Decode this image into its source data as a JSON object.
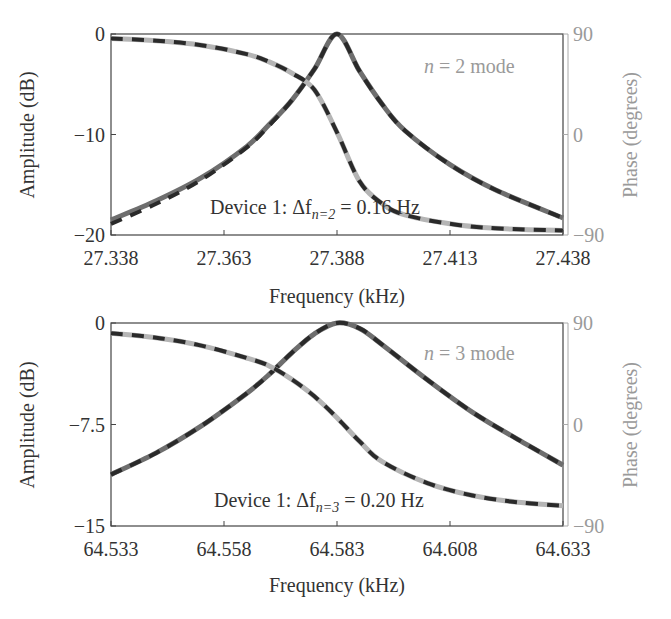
{
  "chart_data": [
    {
      "type": "line",
      "title": "",
      "mode_label": {
        "n": "n",
        "eq": " = 2 mode"
      },
      "annotation": {
        "prefix": "Device 1: Δf",
        "sub": "n=2",
        "suffix": " = 0.16 Hz"
      },
      "xlabel": "Frequency (kHz)",
      "ylabel": "Amplitude (dB)",
      "ylabel_right": "Phase (degrees)",
      "xlim": [
        27.338,
        27.438
      ],
      "ylim": [
        -20,
        0
      ],
      "ylim_right": [
        -90,
        90
      ],
      "xticks": [
        "27.338",
        "27.363",
        "27.388",
        "27.413",
        "27.438"
      ],
      "yticks": [
        "0",
        "−10",
        "−20"
      ],
      "yticks_right": [
        "90",
        "0",
        "−90"
      ],
      "grid": false,
      "resonance_khz": 27.388,
      "linewidth_hz": 0.16,
      "x": [
        27.338,
        27.348,
        27.358,
        27.368,
        27.373,
        27.378,
        27.383,
        27.388,
        27.393,
        27.398,
        27.403,
        27.413,
        27.423,
        27.438
      ],
      "series": [
        {
          "name": "Amplitude (measured)",
          "axis": "left",
          "style": "solid-gray",
          "values": [
            -18.5,
            -16.6,
            -14.3,
            -11.2,
            -9.0,
            -6.6,
            -3.5,
            0.0,
            -3.7,
            -7.0,
            -9.6,
            -13.0,
            -15.5,
            -18.3
          ]
        },
        {
          "name": "Amplitude (fit)",
          "axis": "left",
          "style": "dashed-black",
          "values": [
            -18.9,
            -16.9,
            -14.5,
            -11.3,
            -9.1,
            -6.6,
            -3.5,
            0.0,
            -3.7,
            -7.0,
            -9.6,
            -13.0,
            -15.5,
            -18.3
          ]
        },
        {
          "name": "Phase (measured)",
          "axis": "right",
          "style": "solid-lightgray",
          "values": [
            86,
            84,
            80,
            72,
            65,
            55,
            40,
            2,
            -42,
            -62,
            -72,
            -80,
            -84,
            -86
          ]
        },
        {
          "name": "Phase (fit)",
          "axis": "right",
          "style": "dashed-black",
          "values": [
            86,
            84,
            80,
            72,
            65,
            55,
            40,
            2,
            -42,
            -62,
            -72,
            -80,
            -84,
            -86
          ]
        }
      ]
    },
    {
      "type": "line",
      "title": "",
      "mode_label": {
        "n": "n",
        "eq": " = 3 mode"
      },
      "annotation": {
        "prefix": "Device 1: Δf",
        "sub": "n=3",
        "suffix": " = 0.20 Hz"
      },
      "xlabel": "Frequency (kHz)",
      "ylabel": "Amplitude (dB)",
      "ylabel_right": "Phase (degrees)",
      "xlim": [
        64.533,
        64.633
      ],
      "ylim": [
        -15,
        0
      ],
      "ylim_right": [
        -90,
        90
      ],
      "xticks": [
        "64.533",
        "64.558",
        "64.583",
        "64.608",
        "64.633"
      ],
      "yticks": [
        "0",
        "−7.5",
        "−15"
      ],
      "yticks_right": [
        "90",
        "0",
        "−90"
      ],
      "grid": false,
      "resonance_khz": 64.583,
      "linewidth_hz": 0.2,
      "x": [
        64.533,
        64.543,
        64.553,
        64.563,
        64.568,
        64.573,
        64.578,
        64.583,
        64.588,
        64.593,
        64.603,
        64.613,
        64.623,
        64.633
      ],
      "series": [
        {
          "name": "Amplitude (measured)",
          "axis": "left",
          "style": "solid-gray",
          "values": [
            -11.2,
            -9.6,
            -7.6,
            -5.2,
            -3.8,
            -2.2,
            -0.8,
            0.0,
            -0.4,
            -1.6,
            -4.2,
            -6.6,
            -8.6,
            -10.5
          ]
        },
        {
          "name": "Amplitude (fit)",
          "axis": "left",
          "style": "dashed-black",
          "values": [
            -11.2,
            -9.6,
            -7.6,
            -5.2,
            -3.8,
            -2.2,
            -0.8,
            0.0,
            -0.4,
            -1.6,
            -4.2,
            -6.6,
            -8.6,
            -10.5
          ]
        },
        {
          "name": "Phase (measured)",
          "axis": "right",
          "style": "solid-lightgray",
          "values": [
            81,
            77,
            70,
            59,
            52,
            40,
            25,
            6,
            -15,
            -33,
            -52,
            -63,
            -69,
            -72
          ]
        },
        {
          "name": "Phase (fit)",
          "axis": "right",
          "style": "dashed-black",
          "values": [
            81,
            77,
            70,
            59,
            52,
            40,
            25,
            6,
            -15,
            -33,
            -52,
            -63,
            -69,
            -72
          ]
        }
      ]
    }
  ]
}
